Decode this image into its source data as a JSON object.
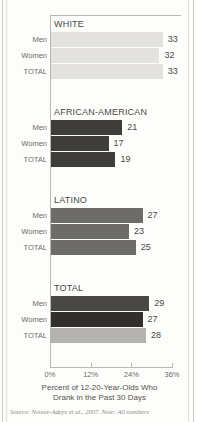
{
  "chart_data": {
    "type": "bar",
    "orientation": "horizontal",
    "title": "",
    "caption_line1": "Percent of 12-20-Year-Olds Who",
    "caption_line2": "Drank in the Past 30 Days",
    "xlabel": "",
    "ylabel": "",
    "xlim": [
      0,
      36
    ],
    "xticks": [
      0,
      12,
      24,
      36
    ],
    "xtick_labels": [
      "0%",
      "12%",
      "24%",
      "36%"
    ],
    "grid": false,
    "legend": "none",
    "categories": [
      "Men",
      "Women",
      "TOTAL"
    ],
    "groups": [
      {
        "name": "WHITE",
        "color": "#e3e2e0",
        "rows": [
          {
            "label": "Men",
            "value": 33,
            "value_text": "33",
            "color": "#e3e2e0"
          },
          {
            "label": "Women",
            "value": 32,
            "value_text": "32",
            "color": "#e3e2e0"
          },
          {
            "label": "TOTAL",
            "value": 33,
            "value_text": "33",
            "color": "#e3e2e0"
          }
        ]
      },
      {
        "name": "AFRICAN-AMERICAN",
        "color": "#3f3d3b",
        "rows": [
          {
            "label": "Men",
            "value": 21,
            "value_text": "21",
            "color": "#3f3d3b"
          },
          {
            "label": "Women",
            "value": 17,
            "value_text": "17",
            "color": "#3f3d3b"
          },
          {
            "label": "TOTAL",
            "value": 19,
            "value_text": "19",
            "color": "#3f3d3b"
          }
        ]
      },
      {
        "name": "LATINO",
        "color": "#6e6c69",
        "rows": [
          {
            "label": "Men",
            "value": 27,
            "value_text": "27",
            "color": "#6e6c69"
          },
          {
            "label": "Women",
            "value": 23,
            "value_text": "23",
            "color": "#6e6c69"
          },
          {
            "label": "TOTAL",
            "value": 25,
            "value_text": "25",
            "color": "#6e6c69"
          }
        ]
      },
      {
        "name": "TOTAL",
        "color": "#4a4846",
        "rows": [
          {
            "label": "Men",
            "value": 29,
            "value_text": "29",
            "color": "#4a4846"
          },
          {
            "label": "Women",
            "value": 27,
            "value_text": "27",
            "color": "#332f2e"
          },
          {
            "label": "TOTAL",
            "value": 28,
            "value_text": "28",
            "color": "#b5b3b0"
          }
        ]
      }
    ]
  },
  "source": {
    "text": "Source: Neuwe-Adeye et al., 2007. Note: All numbers"
  },
  "colors": {
    "axis": "#b9b7b3",
    "text": "#4a4845",
    "muted_text": "#6d6a66",
    "page_background": "#fdfdfc"
  }
}
